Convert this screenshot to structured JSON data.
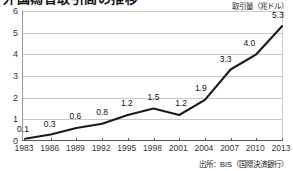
{
  "title": "外国為替取引高の推移",
  "unit_label": "取引量（兆ドル）",
  "source_note": "出所：BIS（国際決済銀行）",
  "axis": {
    "y_ticks": [
      "0",
      "1",
      "2",
      "3",
      "4",
      "5",
      "6"
    ],
    "x_ticks": [
      "1983",
      "1986",
      "1989",
      "1992",
      "1995",
      "1998",
      "2001",
      "2004",
      "2007",
      "2010",
      "2013"
    ]
  },
  "colors": {
    "line": "#1a1a1a",
    "grid": "#c9c9c9",
    "axis": "#5a5a5a",
    "text": "#1a1a1a",
    "background": "#ffffff"
  },
  "chart_data": {
    "type": "line",
    "title": "外国為替取引高の推移",
    "xlabel": "",
    "ylabel": "取引量（兆ドル）",
    "categories": [
      "1983",
      "1986",
      "1989",
      "1992",
      "1995",
      "1998",
      "2001",
      "2004",
      "2007",
      "2010",
      "2013"
    ],
    "values": [
      0.1,
      0.3,
      0.6,
      0.8,
      1.2,
      1.5,
      1.2,
      1.9,
      3.3,
      4.0,
      5.3
    ],
    "data_labels": [
      "0.1",
      "0.3",
      "0.6",
      "0.8",
      "1.2",
      "1.5",
      "1.2",
      "1.9",
      "3.3",
      "4.0",
      "5.3"
    ],
    "ylim": [
      0,
      6
    ],
    "y_tick_step": 1,
    "grid": "horizontal",
    "legend": "none",
    "series": [
      {
        "name": "外国為替取引量",
        "values": [
          0.1,
          0.3,
          0.6,
          0.8,
          1.2,
          1.5,
          1.2,
          1.9,
          3.3,
          4.0,
          5.3
        ]
      }
    ]
  }
}
